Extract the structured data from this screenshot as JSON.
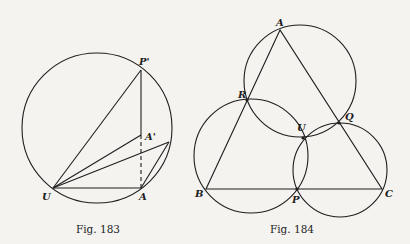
{
  "figures": [
    {
      "id": "fig183",
      "caption": "Fig. 183",
      "circle": {
        "cx": 97,
        "cy": 128,
        "r": 75
      },
      "points": {
        "P_prime": {
          "label": "P'",
          "x": 141,
          "y": 70
        },
        "A_prime": {
          "label": "A'",
          "x": 141,
          "y": 135
        },
        "U": {
          "label": "U",
          "x": 53,
          "y": 188
        },
        "A": {
          "label": "A",
          "x": 141,
          "y": 188
        },
        "X": {
          "label": "",
          "x": 169,
          "y": 142
        }
      }
    },
    {
      "id": "fig184",
      "caption": "Fig. 184",
      "circles": [
        {
          "name": "circle-ARQ",
          "cx": 300,
          "cy": 81,
          "r": 56
        },
        {
          "name": "circle-BPR",
          "cx": 251,
          "cy": 156,
          "r": 57
        },
        {
          "name": "circle-CPQ",
          "cx": 340,
          "cy": 170,
          "r": 47
        }
      ],
      "points": {
        "A": {
          "label": "A",
          "x": 280,
          "y": 30
        },
        "B": {
          "label": "B",
          "x": 206,
          "y": 189
        },
        "C": {
          "label": "C",
          "x": 382,
          "y": 189
        },
        "P": {
          "label": "P",
          "x": 297,
          "y": 189
        },
        "Q": {
          "label": "Q",
          "x": 339,
          "y": 123
        },
        "R": {
          "label": "R",
          "x": 247,
          "y": 100
        },
        "U": {
          "label": "U",
          "x": 303,
          "y": 138
        }
      }
    }
  ]
}
